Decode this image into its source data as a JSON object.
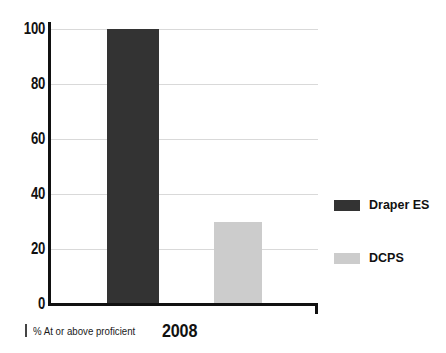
{
  "chart_data": {
    "type": "bar",
    "title": "",
    "categories": [
      "2008"
    ],
    "series": [
      {
        "name": "Draper ES",
        "values": [
          100
        ],
        "color": "#333333"
      },
      {
        "name": "DCPS",
        "values": [
          30
        ],
        "color": "#cccccc"
      }
    ],
    "xlabel": "",
    "ylabel": "% At or above proficient",
    "ylim": [
      0,
      100
    ],
    "yticks": [
      "0",
      "20",
      "40",
      "60",
      "80",
      "100"
    ],
    "ytick_values": [
      0,
      20,
      40,
      60,
      80,
      100
    ],
    "grid": true,
    "legend_position": "right"
  },
  "axis": {
    "note_text": "% At or above proficient",
    "category_label": "2008",
    "tick_labels": {
      "t100": "100",
      "t80": "80",
      "t60": "60",
      "t40": "40",
      "t20": "20",
      "t0": "0"
    }
  },
  "legend": {
    "items": [
      {
        "label": "Draper ES",
        "color": "#333333"
      },
      {
        "label": "DCPS",
        "color": "#cccccc"
      }
    ]
  },
  "colors": {
    "draper": "#333333",
    "dcps": "#cccccc",
    "axis": "#111111",
    "grid": "#d9d9d9",
    "background": "#ffffff"
  }
}
